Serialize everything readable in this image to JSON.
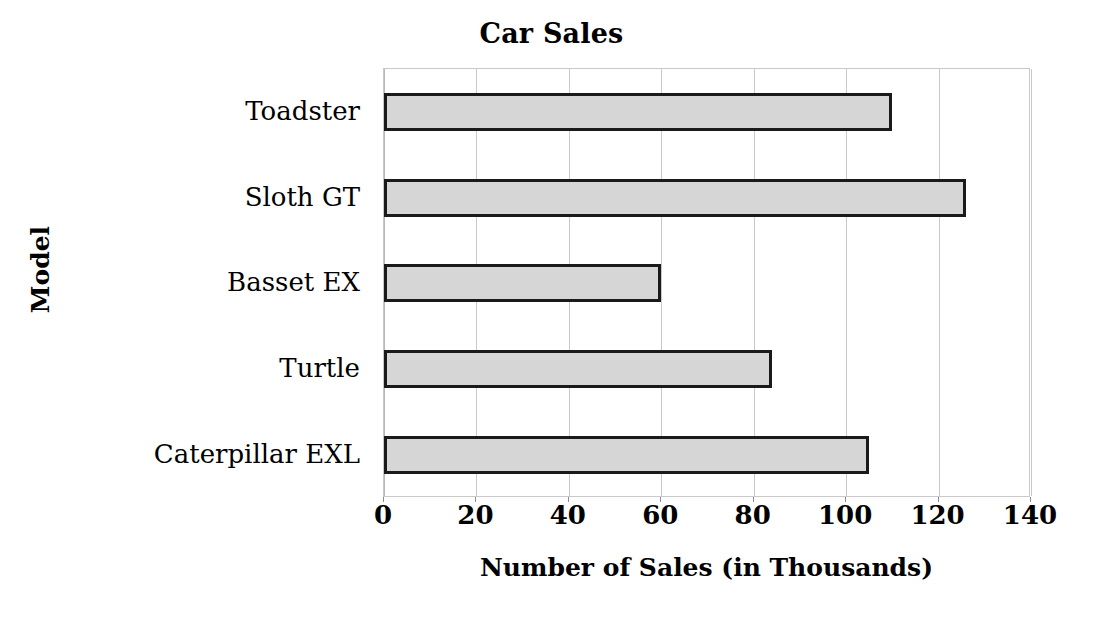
{
  "chart_data": {
    "type": "bar",
    "orientation": "horizontal",
    "title": "Car Sales",
    "xlabel": "Number of Sales (in Thousands)",
    "ylabel": "Model",
    "categories": [
      "Caterpillar EXL",
      "Turtle",
      "Basset EX",
      "Sloth GT",
      "Toadster"
    ],
    "values": [
      105,
      84,
      60,
      126,
      110
    ],
    "xlim": [
      0,
      140
    ],
    "xticks": [
      0,
      20,
      40,
      60,
      80,
      100,
      120,
      140
    ],
    "xtick_labels": [
      "0",
      "20",
      "40",
      "60",
      "80",
      "100",
      "120",
      "140"
    ],
    "grid": true,
    "grid_axis": "x",
    "legend": false,
    "bar_fill_color": "#d6d6d6",
    "bar_border_color": "#1a1a1a",
    "gridline_color": "#c9c9c9",
    "background_color": "#ffffff"
  },
  "display_order_top_to_bottom": [
    {
      "label": "Toadster",
      "value": 110
    },
    {
      "label": "Sloth GT",
      "value": 126
    },
    {
      "label": "Basset EX",
      "value": 60
    },
    {
      "label": "Turtle",
      "value": 84
    },
    {
      "label": "Caterpillar EXL",
      "value": 105
    }
  ]
}
